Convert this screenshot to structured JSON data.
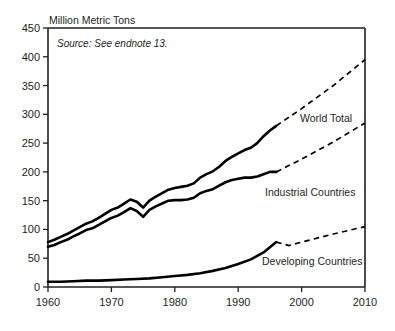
{
  "chart_data": {
    "type": "line",
    "title": "Million Metric Tons",
    "subtitle": "",
    "xlabel": "",
    "ylabel": "Million Metric Tons",
    "annotation": "Source: See endnote 13.",
    "grid": false,
    "legend_position": "inline-right",
    "xlim": [
      1960,
      2010
    ],
    "ylim": [
      0,
      450
    ],
    "yticks": [
      0,
      50,
      100,
      150,
      200,
      250,
      300,
      350,
      400,
      450
    ],
    "ytick_labels": [
      "0",
      "50",
      "100",
      "150",
      "200",
      "250",
      "300",
      "350",
      "400",
      "450"
    ],
    "xticks": [
      1960,
      1970,
      1980,
      1990,
      2000,
      2010
    ],
    "xtick_labels": [
      "1960",
      "1970",
      "1980",
      "1990",
      "2000",
      "2010"
    ],
    "projection_start_year": 1996,
    "series": [
      {
        "name": "World Total",
        "style": "solid-then-dashed",
        "x": [
          1960,
          1961,
          1962,
          1963,
          1964,
          1965,
          1966,
          1967,
          1968,
          1969,
          1970,
          1971,
          1972,
          1973,
          1974,
          1975,
          1976,
          1977,
          1978,
          1979,
          1980,
          1981,
          1982,
          1983,
          1984,
          1985,
          1986,
          1987,
          1988,
          1989,
          1990,
          1991,
          1992,
          1993,
          1994,
          1995,
          1996
        ],
        "values": [
          78,
          82,
          87,
          92,
          98,
          104,
          110,
          114,
          120,
          127,
          134,
          138,
          145,
          152,
          148,
          138,
          150,
          157,
          163,
          169,
          172,
          174,
          176,
          180,
          190,
          196,
          201,
          209,
          219,
          226,
          232,
          238,
          242,
          250,
          262,
          272,
          280
        ],
        "projection_x": [
          1996,
          2000,
          2005,
          2010
        ],
        "projection_values": [
          280,
          310,
          350,
          395
        ]
      },
      {
        "name": "Industrial Countries",
        "style": "solid-then-dashed",
        "x": [
          1960,
          1961,
          1962,
          1963,
          1964,
          1965,
          1966,
          1967,
          1968,
          1969,
          1970,
          1971,
          1972,
          1973,
          1974,
          1975,
          1976,
          1977,
          1978,
          1979,
          1980,
          1981,
          1982,
          1983,
          1984,
          1985,
          1986,
          1987,
          1988,
          1989,
          1990,
          1991,
          1992,
          1993,
          1994,
          1995,
          1996
        ],
        "values": [
          70,
          73,
          78,
          82,
          88,
          93,
          99,
          102,
          108,
          114,
          120,
          124,
          130,
          137,
          132,
          122,
          134,
          140,
          145,
          150,
          151,
          151,
          152,
          155,
          163,
          167,
          170,
          176,
          182,
          186,
          188,
          190,
          190,
          192,
          196,
          200,
          200
        ],
        "projection_x": [
          1996,
          2000,
          2005,
          2010
        ],
        "projection_values": [
          200,
          222,
          252,
          285
        ]
      },
      {
        "name": "Developing Countries",
        "style": "solid-then-dashed",
        "x": [
          1960,
          1962,
          1964,
          1966,
          1968,
          1970,
          1972,
          1974,
          1976,
          1978,
          1980,
          1982,
          1984,
          1986,
          1988,
          1990,
          1992,
          1994,
          1996
        ],
        "values": [
          9,
          9,
          10,
          11,
          11,
          12,
          13,
          14,
          15,
          17,
          19,
          21,
          24,
          28,
          33,
          40,
          48,
          60,
          78
        ],
        "projection_x": [
          1996,
          1998,
          2000,
          2005,
          2010
        ],
        "projection_values": [
          78,
          72,
          78,
          92,
          105
        ]
      }
    ]
  },
  "labels": {
    "world_total": "World Total",
    "industrial_countries": "Industrial Countries",
    "developing_countries": "Developing Countries"
  }
}
